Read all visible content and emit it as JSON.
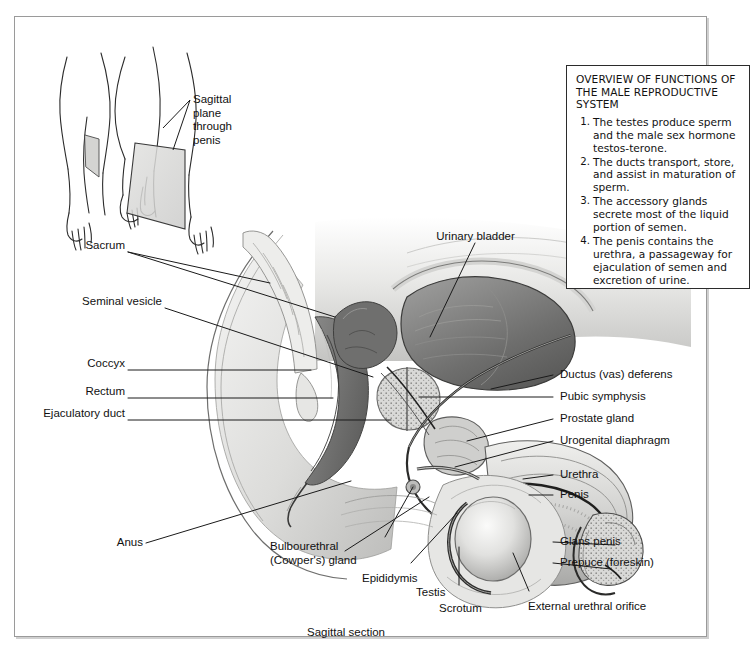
{
  "figure": {
    "caption": "Sagittal section",
    "inset_label": "Sagittal\nplane\nthrough\npenis"
  },
  "overview": {
    "title": "OVERVIEW OF FUNCTIONS OF THE MALE REPRODUCTIVE SYSTEM",
    "items": [
      "The testes produce sperm and the male sex hormone testos-terone.",
      "The ducts transport, store, and assist in maturation of sperm.",
      "The accessory glands secrete most of the liquid portion of semen.",
      "The penis contains the urethra, a passageway for ejaculation of semen and excretion of urine."
    ]
  },
  "labels": {
    "left": [
      {
        "id": "sacrum",
        "text": "Sacrum"
      },
      {
        "id": "seminal-vesicle",
        "text": "Seminal vesicle"
      },
      {
        "id": "coccyx",
        "text": "Coccyx"
      },
      {
        "id": "rectum",
        "text": "Rectum"
      },
      {
        "id": "ejaculatory-duct",
        "text": "Ejaculatory duct"
      },
      {
        "id": "anus",
        "text": "Anus"
      }
    ],
    "right": [
      {
        "id": "ductus-vas-deferens",
        "text": "Ductus (vas) deferens"
      },
      {
        "id": "pubic-symphysis",
        "text": "Pubic symphysis"
      },
      {
        "id": "prostate-gland",
        "text": "Prostate gland"
      },
      {
        "id": "urogenital-diaphragm",
        "text": "Urogenital diaphragm"
      },
      {
        "id": "urethra",
        "text": "Urethra"
      },
      {
        "id": "penis",
        "text": "Penis"
      },
      {
        "id": "glans-penis",
        "text": "Glans penis"
      },
      {
        "id": "prepuce-foreskin",
        "text": "Prepuce (foreskin)"
      }
    ],
    "top": [
      {
        "id": "urinary-bladder",
        "text": "Urinary bladder"
      }
    ],
    "bottom": [
      {
        "id": "bulbourethral-cowpers-gland",
        "text": "Bulbourethral\n(Cowper's) gland"
      },
      {
        "id": "epididymis",
        "text": "Epididymis"
      },
      {
        "id": "testis",
        "text": "Testis"
      },
      {
        "id": "scrotum",
        "text": "Scrotum"
      },
      {
        "id": "external-urethral-orifice",
        "text": "External urethral orifice"
      }
    ]
  },
  "colors": {
    "ink": "#111111",
    "frame": "#9a9a9a",
    "box_border": "#2b2b2b",
    "plane_fill": "#d8d8d6",
    "tissue_light": "#e4e4e2",
    "tissue_mid": "#b9b9b7",
    "tissue_dark": "#7a7a79",
    "tissue_darkest": "#4a4a4a",
    "background": "#ffffff"
  }
}
